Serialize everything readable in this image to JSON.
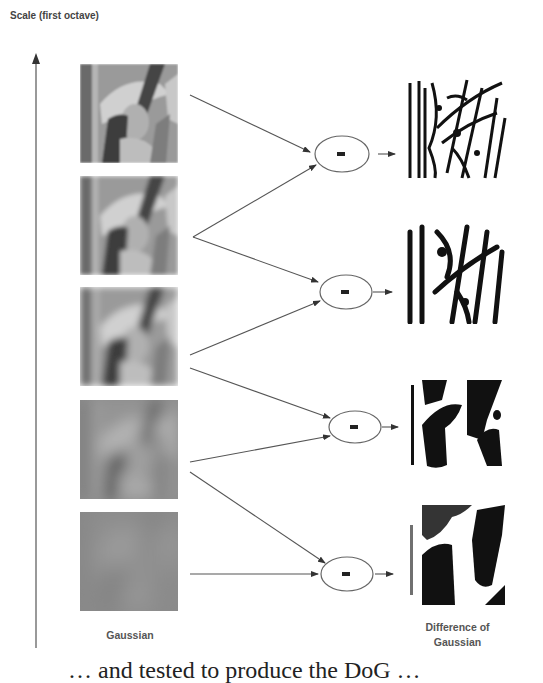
{
  "diagram": {
    "axis_label": "Scale (first octave)",
    "gaussian_label": "Gaussian",
    "dog_label_line1": "Difference of",
    "dog_label_line2": "Gaussian",
    "operator_symbol": "-",
    "caption_fragment": "… and tested to produce the DoG …",
    "gaussian_images": [
      {
        "name": "gaussian-level-1",
        "blur": "low"
      },
      {
        "name": "gaussian-level-2",
        "blur": "low-medium"
      },
      {
        "name": "gaussian-level-3",
        "blur": "medium"
      },
      {
        "name": "gaussian-level-4",
        "blur": "high"
      },
      {
        "name": "gaussian-level-5",
        "blur": "very-high"
      }
    ],
    "dog_images": [
      {
        "name": "dog-level-1",
        "detail": "fine"
      },
      {
        "name": "dog-level-2",
        "detail": "medium-fine"
      },
      {
        "name": "dog-level-3",
        "detail": "medium-coarse"
      },
      {
        "name": "dog-level-4",
        "detail": "coarse"
      }
    ],
    "colors": {
      "line": "#555555",
      "text": "#444444",
      "background": "#ffffff"
    }
  }
}
